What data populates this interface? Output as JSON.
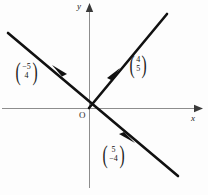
{
  "figure": {
    "type": "vector-diagram",
    "background_color": "#fdfdfd",
    "axes": {
      "x_label": "x",
      "y_label": "y",
      "origin_label": "O",
      "axis_color": "#8d8d8d",
      "x_axis": {
        "x1": 2,
        "y1": 108,
        "x2": 196,
        "y2": 108
      },
      "y_axis": {
        "x1": 89,
        "y1": 188,
        "x2": 89,
        "y2": 6
      },
      "origin": {
        "x": 89,
        "y": 108
      }
    },
    "lines": [
      {
        "name": "line-rising",
        "color": "#111111",
        "width": 2.6,
        "from": {
          "x": 89,
          "y": 108
        },
        "to": {
          "x": 167,
          "y": 14
        }
      },
      {
        "name": "line-falling",
        "color": "#111111",
        "width": 2.6,
        "from": {
          "x": 8,
          "y": 33
        },
        "to": {
          "x": 178,
          "y": 176
        }
      }
    ],
    "arrow_markers": [
      {
        "name": "arrow-up-right",
        "x": 117,
        "y": 72,
        "angle": -50
      },
      {
        "name": "arrow-up-left",
        "x": 57,
        "y": 69,
        "angle": 220
      },
      {
        "name": "arrow-down-right",
        "x": 130,
        "y": 140,
        "angle": 40
      }
    ],
    "vectors": [
      {
        "name": "vector-label-minus5-4",
        "top": "−5",
        "bottom": "4",
        "position": "upper-left"
      },
      {
        "name": "vector-label-4-5",
        "top": "4",
        "bottom": "5",
        "position": "upper-right"
      },
      {
        "name": "vector-label-5-minus4",
        "top": "5",
        "bottom": "−4",
        "position": "lower-right"
      }
    ],
    "paren_left": "(",
    "paren_right": ")"
  }
}
